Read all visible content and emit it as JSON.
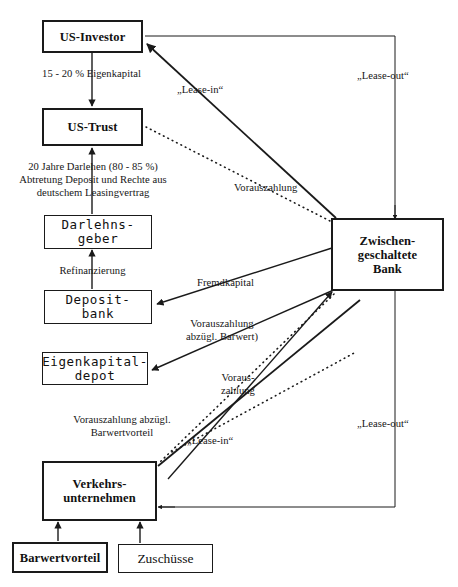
{
  "diagram": {
    "nodes": [
      {
        "id": "us_investor",
        "label": "US-Investor"
      },
      {
        "id": "us_trust",
        "label": "US-Trust"
      },
      {
        "id": "darlehnsgeber",
        "label": "Darlehns-\ngeber"
      },
      {
        "id": "depositbank",
        "label": "Deposit-\nbank"
      },
      {
        "id": "eigenkapital",
        "label": "Eigenkapital-\ndepot"
      },
      {
        "id": "verkehr",
        "label": "Verkehrs-\nunternehmen"
      },
      {
        "id": "barwertvorteil",
        "label": "Barwertvorteil"
      },
      {
        "id": "zuschuesse",
        "label": "Zuschüsse"
      },
      {
        "id": "bank",
        "label": "Zwischen-\ngeschaltete\nBank"
      }
    ],
    "edge_labels": [
      {
        "id": "eigenkapital_pct",
        "text": "15 - 20 % Eigenkapital"
      },
      {
        "id": "darlehen_terms",
        "text": "20 Jahre Darlehen (80 - 85 %)\nAbtretung Deposit und Rechte aus\ndeutschem Leasingvertrag"
      },
      {
        "id": "refinanzierung",
        "text": "Refinanzierung"
      },
      {
        "id": "lease_in_top",
        "text": "„Lease-in“"
      },
      {
        "id": "lease_out_top",
        "text": "„Lease-out“"
      },
      {
        "id": "vorauszahlung_top",
        "text": "Vorauszahlung"
      },
      {
        "id": "fremdkapital",
        "text": "Fremdkapital"
      },
      {
        "id": "voraus_abzugl_bw",
        "text": "Vorauszahlung\nabzügl. Barwert)"
      },
      {
        "id": "voraus_zahlung",
        "text": "Voraus-\nzahlung"
      },
      {
        "id": "voraus_abzugl_bwv",
        "text": "Vorauszahlung abzügl.\nBarwertvorteil"
      },
      {
        "id": "lease_in_bottom",
        "text": "„Lease-in“"
      },
      {
        "id": "lease_out_bottom",
        "text": "„Lease-out“"
      }
    ],
    "colors": {
      "stroke": "#1a1a1a",
      "background": "#ffffff",
      "text": "#111111"
    }
  }
}
